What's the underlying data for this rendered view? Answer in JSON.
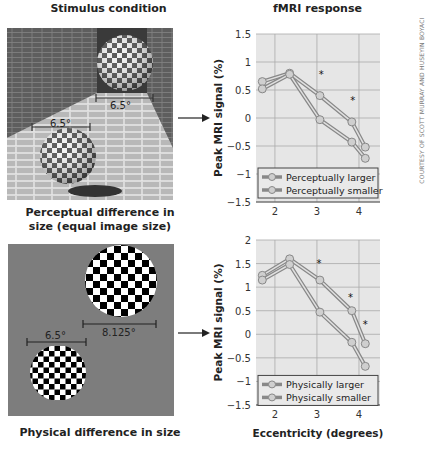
{
  "headers": {
    "left": "Stimulus condition",
    "right": "fMRI response"
  },
  "panels": {
    "top": {
      "caption_line1": "Perceptual difference in",
      "caption_line2": "size (equal image size)",
      "stimulus": {
        "label_far": "6.5°",
        "label_near": "6.5°",
        "background": "brick corridor"
      }
    },
    "bottom": {
      "caption": "Physical difference in size",
      "stimulus": {
        "label_large": "8.125°",
        "label_small": "6.5°",
        "background": "#7d7d7d"
      }
    }
  },
  "credit": "COURTESY OF SCOTT MURRAY AND HUSEYIN BOYACI",
  "chart_data": [
    {
      "type": "line",
      "title": "fMRI response",
      "xlabel": "",
      "ylabel": "Peak MRI signal (%)",
      "x": [
        1.7,
        2.35,
        3.07,
        3.83,
        4.15
      ],
      "xticks": [
        2,
        3,
        4
      ],
      "yticks": [
        1.5,
        1,
        0.5,
        0,
        -0.5,
        -1,
        -1.5
      ],
      "xlim": [
        1.55,
        4.5
      ],
      "ylim": [
        -1.5,
        1.5
      ],
      "grid": true,
      "legend_position": "lower left",
      "series": [
        {
          "name": "Perceptually larger",
          "values": [
            0.65,
            0.8,
            0.4,
            -0.07,
            -0.52
          ]
        },
        {
          "name": "Perceptually smaller",
          "values": [
            0.52,
            0.78,
            -0.03,
            -0.43,
            -0.72
          ]
        }
      ],
      "annotations": [
        {
          "text": "*",
          "x": 3.1,
          "y": 0.78
        },
        {
          "text": "*",
          "x": 3.85,
          "y": 0.32
        }
      ]
    },
    {
      "type": "line",
      "title": "",
      "xlabel": "Eccentricity (degrees)",
      "ylabel": "Peak MRI signal (%)",
      "x": [
        1.7,
        2.35,
        3.07,
        3.83,
        4.15
      ],
      "xticks": [
        2,
        3,
        4
      ],
      "yticks": [
        2,
        1.5,
        1,
        0.5,
        0,
        -0.5,
        -1,
        -1.5
      ],
      "xlim": [
        1.55,
        4.5
      ],
      "ylim": [
        -1.5,
        2
      ],
      "grid": true,
      "legend_position": "lower left",
      "series": [
        {
          "name": "Physically larger",
          "values": [
            1.25,
            1.6,
            1.15,
            0.5,
            -0.2
          ]
        },
        {
          "name": "Physically smaller",
          "values": [
            1.15,
            1.48,
            0.47,
            -0.17,
            -0.68
          ]
        }
      ],
      "annotations": [
        {
          "text": "*",
          "x": 3.05,
          "y": 1.52
        },
        {
          "text": "*",
          "x": 3.8,
          "y": 0.8
        },
        {
          "text": "*",
          "x": 4.15,
          "y": 0.22
        }
      ]
    }
  ]
}
